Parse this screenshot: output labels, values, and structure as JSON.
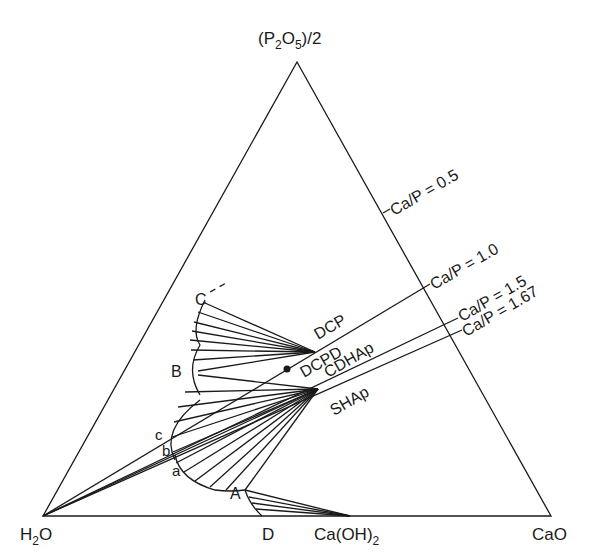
{
  "diagram": {
    "type": "ternary-phase-diagram",
    "vertices": {
      "top": {
        "label": "(P2O5)/2",
        "main": "(P",
        "sub1": "2",
        "mid": "O",
        "sub2": "5",
        "tail": ")/2"
      },
      "left": {
        "label": "H2O",
        "main": "H",
        "sub": "2",
        "tail": "O"
      },
      "right": {
        "label": "CaO"
      }
    },
    "baseline_points": {
      "ca_oh2": {
        "label": "Ca(OH)2",
        "main": "Ca(OH)",
        "sub": "2"
      },
      "D": "D"
    },
    "ratio_lines": [
      {
        "label": "Ca/P = 0.5"
      },
      {
        "label": "Ca/P = 1.0"
      },
      {
        "label": "Ca/P = 1.5"
      },
      {
        "label": "Ca/P = 1.67"
      }
    ],
    "phases": {
      "dcp": "DCP",
      "dcpd": "DCPD",
      "cdhap": "CDHAp",
      "shap": "SHAp"
    },
    "curve_points": {
      "A": "A",
      "B": "B",
      "C": "C",
      "a": "a",
      "b": "b",
      "c": "c"
    },
    "colors": {
      "line": "#1a1a1a",
      "background": "#ffffff"
    }
  }
}
